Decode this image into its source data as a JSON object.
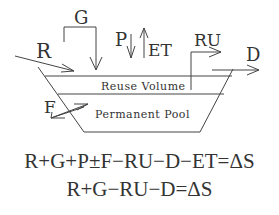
{
  "diagram": {
    "labels": {
      "R": "R",
      "G": "G",
      "P": "P",
      "ET": "ET",
      "RU": "RU",
      "D": "D",
      "F": "F"
    },
    "zones": {
      "reuse": "Reuse Volume",
      "permanent": "Permanent Pool"
    }
  },
  "equations": {
    "full": "R+G+P±F−RU−D−ET=ΔS",
    "simplified": "R+G−RU−D=ΔS"
  },
  "colors": {
    "stroke": "#444444",
    "text": "#333333"
  }
}
